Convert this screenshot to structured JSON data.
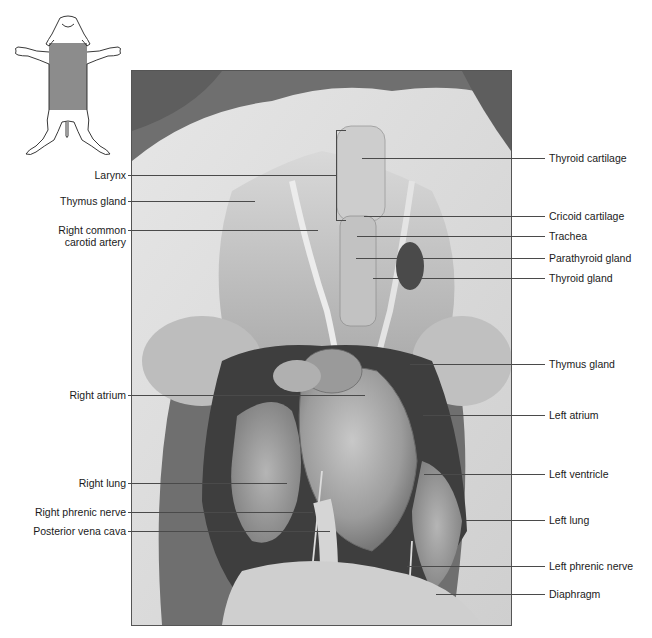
{
  "figure": {
    "photo_tone": "grayscale",
    "colors": {
      "leader_line": "#4a4a4a",
      "label_text": "#1a1a1a",
      "icon_shading": "#8c8c8c",
      "background": "#ffffff"
    }
  },
  "orientation_icon": {
    "name": "fetal-pig-ventral-view",
    "shaded_region": "thoracic-and-neck-region"
  },
  "labels_left": [
    {
      "id": "larynx",
      "text": "Larynx",
      "y": 175
    },
    {
      "id": "thymus-gland-left",
      "text": "Thymus gland",
      "y": 201
    },
    {
      "id": "right-common-carotid-artery",
      "text": "Right common",
      "text2": "carotid artery",
      "y": 230
    },
    {
      "id": "right-atrium",
      "text": "Right atrium",
      "y": 395
    },
    {
      "id": "right-lung",
      "text": "Right lung",
      "y": 483
    },
    {
      "id": "right-phrenic-nerve",
      "text": "Right phrenic nerve",
      "y": 512
    },
    {
      "id": "posterior-vena-cava",
      "text": "Posterior vena cava",
      "y": 531
    }
  ],
  "labels_right": [
    {
      "id": "thyroid-cartilage",
      "text": "Thyroid cartilage",
      "y": 158
    },
    {
      "id": "cricoid-cartilage",
      "text": "Cricoid cartilage",
      "y": 216
    },
    {
      "id": "trachea",
      "text": "Trachea",
      "y": 236
    },
    {
      "id": "parathyroid-gland",
      "text": "Parathyroid gland",
      "y": 258
    },
    {
      "id": "thyroid-gland",
      "text": "Thyroid gland",
      "y": 278
    },
    {
      "id": "thymus-gland-right",
      "text": "Thymus gland",
      "y": 364
    },
    {
      "id": "left-atrium",
      "text": "Left atrium",
      "y": 415
    },
    {
      "id": "left-ventricle",
      "text": "Left ventricle",
      "y": 474
    },
    {
      "id": "left-lung",
      "text": "Left lung",
      "y": 520
    },
    {
      "id": "left-phrenic-nerve",
      "text": "Left phrenic nerve",
      "y": 566
    },
    {
      "id": "diaphragm",
      "text": "Diaphragm",
      "y": 594
    }
  ]
}
